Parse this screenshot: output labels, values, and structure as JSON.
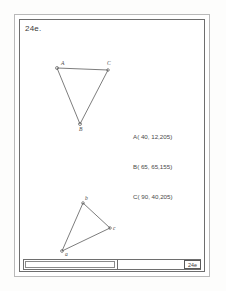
{
  "sheet": {
    "problem_label": "24e.",
    "title_block_label": "24e"
  },
  "coordinates": {
    "lines": [
      "A( 40, 12,205)",
      "B( 65, 65,155)",
      "C( 90, 40,205)"
    ]
  },
  "upper_triangle": {
    "labels": {
      "a": "A",
      "b": "B",
      "c": "C"
    }
  },
  "lower_triangle": {
    "labels": {
      "a": "a",
      "b": "b",
      "c": "c"
    }
  },
  "colors": {
    "line": "#5c5c5c",
    "frame": "#6e6e6e",
    "outer_frame": "#b9b9b9",
    "text": "#4a4a4a",
    "paper": "#ffffff"
  }
}
